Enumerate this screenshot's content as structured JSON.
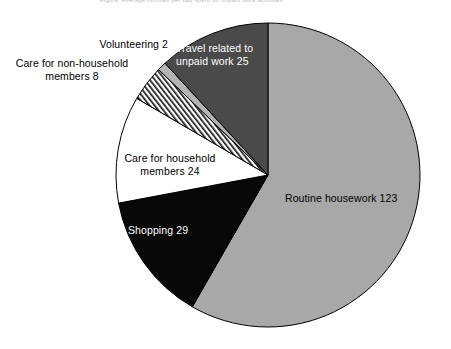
{
  "chart_data": {
    "type": "pie",
    "title": "Figure: Average minutes per day spent on unpaid work activities",
    "total": 211,
    "units": "minutes per day",
    "start_angle_deg": 0,
    "direction": "clockwise",
    "legend": "none",
    "grid": false,
    "categories": [
      "Routine housework",
      "Shopping",
      "Care for household members",
      "Care for non-household members",
      "Volunteering",
      "Travel related to unpaid work"
    ],
    "values": [
      123,
      29,
      24,
      8,
      2,
      25
    ],
    "slices": [
      {
        "name": "routine-housework",
        "label": "Routine housework 123",
        "category": "Routine housework",
        "value": 123,
        "fill": "#a8a8a8",
        "pattern": "solid",
        "text_color": "#000000",
        "start_deg": 0,
        "sweep_deg": 209.86,
        "label_x": 285,
        "label_y": 192,
        "label_w": 150,
        "label_align": "left"
      },
      {
        "name": "shopping",
        "label": "Shopping 29",
        "category": "Shopping",
        "value": 29,
        "fill": "#080808",
        "pattern": "solid",
        "text_color": "#ffffff",
        "start_deg": 209.86,
        "sweep_deg": 49.48,
        "label_x": 128,
        "label_y": 224,
        "label_w": 100,
        "label_align": "left"
      },
      {
        "name": "care-for-household-members",
        "label": "Care for household\nmembers 24",
        "category": "Care for household members",
        "value": 24,
        "fill": "#ffffff",
        "pattern": "solid",
        "text_color": "#000000",
        "start_deg": 259.34,
        "sweep_deg": 40.95,
        "label_x": 108,
        "label_y": 152,
        "label_w": 124,
        "label_align": "center"
      },
      {
        "name": "care-for-non-household-members",
        "label": "Care for non-household\nmembers 8",
        "category": "Care for non-household members",
        "value": 8,
        "fill": "#ffffff",
        "pattern": "diagonal-hatch",
        "text_color": "#000000",
        "start_deg": 300.29,
        "sweep_deg": 13.65,
        "label_x": 2,
        "label_y": 57,
        "label_w": 140,
        "label_align": "center"
      },
      {
        "name": "volunteering",
        "label": "Volunteering 2",
        "category": "Volunteering",
        "value": 2,
        "fill": "#b4b4b4",
        "pattern": "solid",
        "text_color": "#000000",
        "start_deg": 313.94,
        "sweep_deg": 3.41,
        "label_x": 58,
        "label_y": 38,
        "label_w": 110,
        "label_align": "right"
      },
      {
        "name": "travel-related-to-unpaid-work",
        "label": "Travel related to\nunpaid work 25",
        "category": "Travel related to unpaid work",
        "value": 25,
        "fill": "#4a4a4a",
        "pattern": "solid",
        "text_color": "#ffffff",
        "start_deg": 317.35,
        "sweep_deg": 42.65,
        "label_x": 176,
        "label_y": 42,
        "label_w": 110,
        "label_align": "left"
      }
    ],
    "geometry": {
      "cx": 268,
      "cy": 175,
      "r": 152
    },
    "stroke_color": "#000000"
  }
}
